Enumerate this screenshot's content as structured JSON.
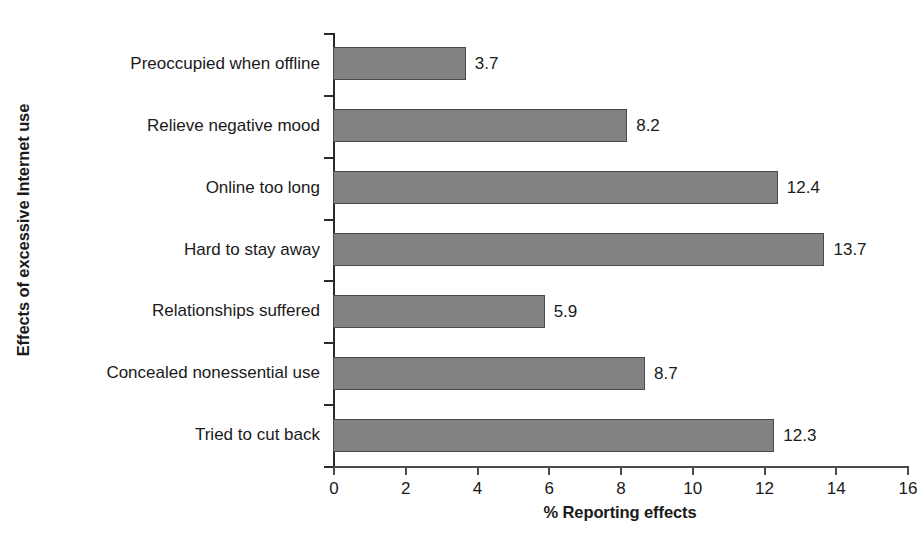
{
  "chart_data": {
    "type": "bar",
    "orientation": "horizontal",
    "title": "",
    "xlabel": "% Reporting effects",
    "ylabel": "Effects of excessive Internet use",
    "categories": [
      "Preoccupied when offline",
      "Relieve negative mood",
      "Online too long",
      "Hard to stay away",
      "Relationships suffered",
      "Concealed nonessential use",
      "Tried to cut back"
    ],
    "values": [
      3.7,
      8.2,
      12.4,
      13.7,
      5.9,
      8.7,
      12.3
    ],
    "value_labels": [
      "3.7",
      "8.2",
      "12.4",
      "13.7",
      "5.9",
      "8.7",
      "12.3"
    ],
    "xlim": [
      0,
      16
    ],
    "xticks": [
      0,
      2,
      4,
      6,
      8,
      10,
      12,
      14,
      16
    ],
    "xtick_labels": [
      "0",
      "2",
      "4",
      "6",
      "8",
      "10",
      "12",
      "14",
      "16"
    ],
    "grid": false,
    "legend": false,
    "bar_fill_color": "#828282",
    "bar_edge_color": "#4a4a4a",
    "axis_color": "#4a4a4a",
    "text_color": "#1a1a1a"
  }
}
